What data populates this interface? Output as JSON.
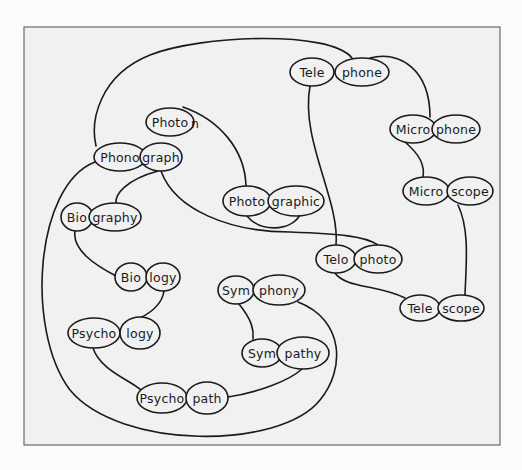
{
  "diagram": {
    "type": "morpheme-word-network",
    "frame": {
      "x": 24,
      "y": 27,
      "w": 476,
      "h": 418,
      "fill": "#f1f1f1",
      "stroke": "#6a6a6a"
    },
    "colors": {
      "line": "#1a1a1a",
      "background": "#fbfbfb",
      "panel": "#f1f1f1"
    },
    "words": [
      {
        "id": "telephone",
        "parts": [
          {
            "text": "Tele",
            "cx": 312,
            "cy": 72,
            "rx": 22,
            "ry": 14
          },
          {
            "text": "phone",
            "cx": 362,
            "cy": 72,
            "rx": 27,
            "ry": 14
          }
        ]
      },
      {
        "id": "photon",
        "parts": [
          {
            "text": "Photo",
            "cx": 170,
            "cy": 122,
            "rx": 24,
            "ry": 14
          }
        ],
        "tail": {
          "text": "n",
          "x": 195,
          "y": 123
        }
      },
      {
        "id": "microphone",
        "parts": [
          {
            "text": "Micro",
            "cx": 413,
            "cy": 129,
            "rx": 23,
            "ry": 14
          },
          {
            "text": "phone",
            "cx": 456,
            "cy": 129,
            "rx": 24,
            "ry": 14
          }
        ]
      },
      {
        "id": "phonograph",
        "parts": [
          {
            "text": "Phono",
            "cx": 120,
            "cy": 157,
            "rx": 26,
            "ry": 14
          },
          {
            "text": "graph",
            "cx": 161,
            "cy": 157,
            "rx": 21,
            "ry": 14
          }
        ]
      },
      {
        "id": "microscope",
        "parts": [
          {
            "text": "Micro",
            "cx": 426,
            "cy": 191,
            "rx": 23,
            "ry": 14
          },
          {
            "text": "scope",
            "cx": 470,
            "cy": 191,
            "rx": 23,
            "ry": 14
          }
        ]
      },
      {
        "id": "photographic",
        "parts": [
          {
            "text": "Photo",
            "cx": 247,
            "cy": 201,
            "rx": 24,
            "ry": 15
          },
          {
            "text": "graphic",
            "cx": 296,
            "cy": 201,
            "rx": 28,
            "ry": 15
          }
        ]
      },
      {
        "id": "biography",
        "parts": [
          {
            "text": "Bio",
            "cx": 77,
            "cy": 217,
            "rx": 16,
            "ry": 14
          },
          {
            "text": "graphy",
            "cx": 115,
            "cy": 217,
            "rx": 26,
            "ry": 14
          }
        ]
      },
      {
        "id": "telophoto",
        "parts": [
          {
            "text": "Telo",
            "cx": 336,
            "cy": 259,
            "rx": 20,
            "ry": 14
          },
          {
            "text": "photo",
            "cx": 378,
            "cy": 259,
            "rx": 24,
            "ry": 14
          }
        ]
      },
      {
        "id": "biology",
        "parts": [
          {
            "text": "Bio",
            "cx": 131,
            "cy": 277,
            "rx": 16,
            "ry": 14
          },
          {
            "text": "logy",
            "cx": 163,
            "cy": 277,
            "rx": 17,
            "ry": 14
          }
        ]
      },
      {
        "id": "symphony",
        "parts": [
          {
            "text": "Sym",
            "cx": 236,
            "cy": 290,
            "rx": 18,
            "ry": 14
          },
          {
            "text": "phony",
            "cx": 279,
            "cy": 290,
            "rx": 26,
            "ry": 15
          }
        ]
      },
      {
        "id": "telescope",
        "parts": [
          {
            "text": "Tele",
            "cx": 420,
            "cy": 308,
            "rx": 20,
            "ry": 13
          },
          {
            "text": "scope",
            "cx": 461,
            "cy": 308,
            "rx": 23,
            "ry": 13
          }
        ]
      },
      {
        "id": "psychology",
        "parts": [
          {
            "text": "Psycho",
            "cx": 94,
            "cy": 333,
            "rx": 26,
            "ry": 15
          },
          {
            "text": "logy",
            "cx": 140,
            "cy": 333,
            "rx": 20,
            "ry": 16
          }
        ]
      },
      {
        "id": "sympathy",
        "parts": [
          {
            "text": "Sym",
            "cx": 262,
            "cy": 353,
            "rx": 20,
            "ry": 14
          },
          {
            "text": "pathy",
            "cx": 303,
            "cy": 353,
            "rx": 26,
            "ry": 16
          }
        ]
      },
      {
        "id": "psychopath",
        "parts": [
          {
            "text": "Psycho",
            "cx": 162,
            "cy": 398,
            "rx": 25,
            "ry": 15
          },
          {
            "text": "path",
            "cx": 207,
            "cy": 398,
            "rx": 21,
            "ry": 16
          }
        ]
      }
    ],
    "links": [
      {
        "from": "Tele(telephone)",
        "to": "Tele(telescope)... via Telo",
        "d": "M 310 86 C 300 140, 340 200, 336 245"
      },
      {
        "from": "phone(telephone)",
        "to": "Phono(phonograph)",
        "d": "M 352 58 C 330 30, 200 35, 150 55 C 100 75, 90 120, 96 146"
      },
      {
        "from": "phone(telephone)",
        "to": "phone(microphone)",
        "d": "M 370 58 C 400 50, 430 70, 430 117"
      },
      {
        "from": "Photo(photon)",
        "to": "Photo(photographic)",
        "d": "M 183 107 C 220 120, 245 150, 246 186"
      },
      {
        "from": "Micro(microphone)",
        "to": "Micro(microscope)",
        "d": "M 405 142 C 420 155, 425 165, 423 178"
      },
      {
        "from": "graph(phonograph)",
        "to": "graphy(biography)",
        "d": "M 158 171 C 125 180, 115 195, 116 203"
      },
      {
        "from": "graph(phonograph)",
        "to": "photo(telophoto)",
        "d": "M 161 171 C 175 210, 230 232, 290 232 C 340 234, 365 236, 378 245"
      },
      {
        "from": "Photo(photographic)",
        "to": "graphic(photographic) crossing",
        "d": "M 247 216 C 260 232, 290 232, 300 215"
      },
      {
        "from": "scope(microscope)",
        "to": "scope(telescope)",
        "d": "M 458 205 C 470 230, 466 265, 465 295"
      },
      {
        "from": "Telo(telophoto)",
        "to": "Tele(telescope)",
        "d": "M 335 273 C 345 288, 380 285, 405 298"
      },
      {
        "from": "Bio(biography)",
        "to": "Bio(biology)",
        "d": "M 75 231 C 72 250, 95 265, 116 276"
      },
      {
        "from": "logy(biology)",
        "to": "logy(psychology)",
        "d": "M 164 291 C 162 305, 150 313, 140 318"
      },
      {
        "from": "Phono(phonograph)",
        "to": "phony(symphony) big loop",
        "d": "M 95 162 C 35 185, 25 330, 70 390 C 120 450, 280 450, 320 400 C 345 370, 345 320, 298 302"
      },
      {
        "from": "Sym(symphony)",
        "to": "Sym(sympathy)",
        "d": "M 239 304 C 252 320, 254 330, 253 339"
      },
      {
        "from": "Psycho(psychology)",
        "to": "Psycho(psychopath)",
        "d": "M 93 348 C 100 370, 130 380, 141 390"
      },
      {
        "from": "path(psychopath)",
        "to": "pathy(sympathy)",
        "d": "M 228 397 C 260 392, 290 380, 302 369"
      }
    ]
  }
}
